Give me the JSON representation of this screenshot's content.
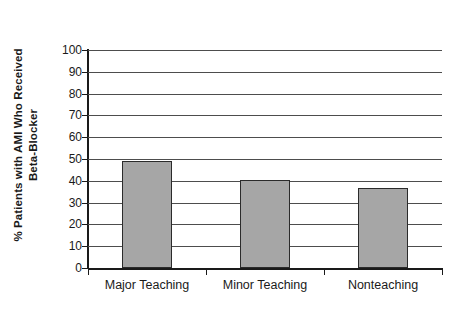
{
  "chart_data": {
    "type": "bar",
    "title": "",
    "categories": [
      "Major Teaching",
      "Minor Teaching",
      "Nonteaching"
    ],
    "values": [
      49,
      40.5,
      36.5
    ],
    "xlabel": "",
    "ylabel": "% Patients with AMI Who Received Beta-Blocker",
    "ylabel_line1": "% Patients with AMI Who Received",
    "ylabel_line2": "Beta-Blocker",
    "ylim": [
      0,
      100
    ],
    "ytick_step": 10,
    "yticks": [
      "100",
      "90",
      "80",
      "70",
      "60",
      "50",
      "40",
      "30",
      "20",
      "10",
      "0"
    ],
    "grid": true,
    "legend": false,
    "bar_fill_color": "#a6a6a6",
    "bar_border_color": "#2b2b2b",
    "gridline_color": "#4d4d4d",
    "axis_color": "#1a1a1a",
    "background_color": "#ffffff"
  }
}
